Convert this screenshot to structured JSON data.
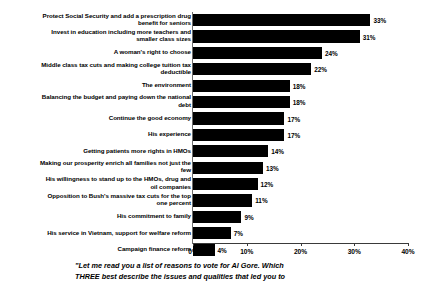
{
  "chart_data": {
    "type": "bar",
    "orientation": "horizontal",
    "title": "",
    "xlabel": "",
    "ylabel": "",
    "xlim": [
      0,
      40
    ],
    "grid": false,
    "legend": null,
    "tick_labels": [
      "0%",
      "10%",
      "20%",
      "30%",
      "40%"
    ],
    "tick_values": [
      0,
      10,
      20,
      30,
      40
    ],
    "value_suffix": "%",
    "bar_color": "#000000",
    "categories": [
      "Protect Social Security and add a prescription drug\nbenefit for seniors",
      "Invest in education including more  teachers and\nsmaller class sizes",
      "A woman's right to choose",
      "Middle class tax cuts and making college tuition tax\ndeductible",
      "The environment",
      "Balancing the budget and paying down the national\ndebt",
      "Continue the good economy",
      "His experience",
      "Getting patients more rights in HMOs",
      "Making our prosperity enrich all families not just the\nfew",
      "His willingness to stand up to the HMOs, drug and\noil companies",
      "Opposition to Bush's massive tax cuts for the top\none percent",
      "His commitment to family",
      "His service in Vietnam, support for welfare reform",
      "Campaign finance reform"
    ],
    "values": [
      33,
      31,
      24,
      22,
      18,
      18,
      17,
      17,
      14,
      13,
      12,
      11,
      9,
      7,
      4
    ],
    "value_labels": [
      "33%",
      "31%",
      "24%",
      "22%",
      "18%",
      "18%",
      "17%",
      "17%",
      "14%",
      "13%",
      "12%",
      "11%",
      "9%",
      "7%",
      "4%"
    ]
  },
  "caption": {
    "line1": "\"Let me read you a list of reasons to vote for Al Gore.  Which",
    "line2": "THREE best describe the issues and qualities that led you to"
  }
}
